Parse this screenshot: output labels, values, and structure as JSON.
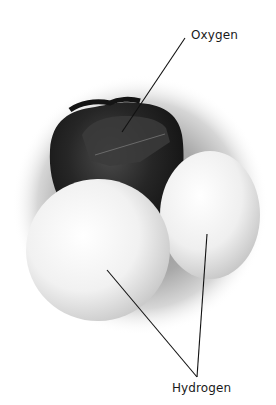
{
  "diagram": {
    "labels": [
      {
        "id": "oxygen",
        "text": "Oxygen"
      },
      {
        "id": "hydrogen",
        "text": "Hydrogen"
      }
    ],
    "colors": {
      "background": "#ffffff",
      "oxygen_atom": "#1c1c1c",
      "hydrogen_atom": "#f2f2f2",
      "shadow": "#9a9a9a",
      "leader_line": "#111111"
    }
  }
}
